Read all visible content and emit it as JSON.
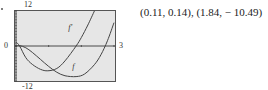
{
  "chart_data": {
    "type": "line",
    "title": "",
    "xlabel": "",
    "ylabel": "",
    "xlim": [
      0,
      3
    ],
    "ylim": [
      -12,
      12
    ],
    "grid": false,
    "tick_labels": {
      "ymax": "12",
      "ymin": "-12",
      "xmin": "0",
      "xmax": "3"
    },
    "series": [
      {
        "name": "f",
        "label": "f",
        "x": [
          0,
          0.11,
          0.3,
          0.5,
          0.75,
          1.0,
          1.25,
          1.5,
          1.84,
          2.1,
          2.4,
          2.6,
          2.8,
          3.0
        ],
        "y": [
          0.0,
          0.14,
          -0.6,
          -2.2,
          -4.6,
          -7.0,
          -9.0,
          -10.2,
          -10.49,
          -9.6,
          -6.4,
          -3.0,
          1.8,
          8.0
        ]
      },
      {
        "name": "f'",
        "label": "f'",
        "x": [
          0,
          0.11,
          0.3,
          0.5,
          0.75,
          0.975,
          1.25,
          1.5,
          1.84,
          2.0,
          2.2,
          2.4
        ],
        "y": [
          1.4,
          0.0,
          -4.0,
          -6.3,
          -8.0,
          -8.5,
          -7.7,
          -5.1,
          0.0,
          2.9,
          7.2,
          12.0
        ]
      }
    ]
  },
  "annotation": "(0.11, 0.14), (1.84, − 10.49)",
  "colors": {
    "plot_bg": "#e6e6e6",
    "frame": "#555555",
    "curve": "#444444"
  }
}
